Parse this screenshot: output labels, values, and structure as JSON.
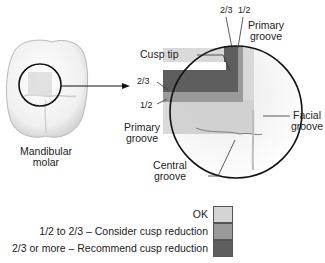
{
  "diagram": {
    "tooth_label_line1": "Mandibular",
    "tooth_label_line2": "molar",
    "labels": {
      "cusp_tip": "Cusp tip",
      "two_thirds_top": "2/3",
      "one_half_top": "1/2",
      "primary_groove_top_line1": "Primary",
      "primary_groove_top_line2": "groove",
      "two_thirds_left": "2/3",
      "one_half_left": "1/2",
      "primary_groove_left_line1": "Primary",
      "primary_groove_left_line2": "groove",
      "facial_groove_line1": "Facial",
      "facial_groove_line2": "groove",
      "central_groove_line1": "Central",
      "central_groove_line2": "groove"
    }
  },
  "legend": {
    "items": [
      {
        "label": "OK",
        "color": "#d4d4d4"
      },
      {
        "label": "1/2 to 2/3 – Consider cusp reduction",
        "color": "#9a9a9a"
      },
      {
        "label": "2/3 or more – Recommend cusp reduction",
        "color": "#5e5e5e"
      }
    ]
  },
  "colors": {
    "ok": "#d4d4d4",
    "consider": "#9a9a9a",
    "recommend": "#5e5e5e",
    "outline": "#111111"
  }
}
